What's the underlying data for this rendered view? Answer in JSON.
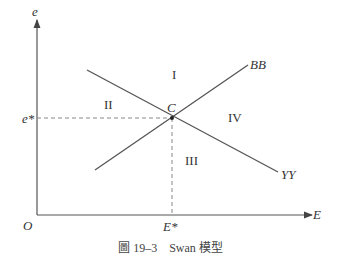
{
  "diagram": {
    "axes": {
      "y_label": "e",
      "x_label": "E",
      "origin_label": "O",
      "y_equilibrium_label": "e*",
      "x_equilibrium_label": "E*"
    },
    "curves": [
      {
        "name": "BB",
        "label": "BB",
        "slope": "upward"
      },
      {
        "name": "YY",
        "label": "YY",
        "slope": "downward"
      }
    ],
    "intersection_label": "C",
    "regions": [
      "I",
      "II",
      "III",
      "IV"
    ],
    "caption": "圖 19–3　Swan 模型",
    "colors": {
      "line": "#555555",
      "dashed": "#888888",
      "text": "#333333"
    }
  }
}
